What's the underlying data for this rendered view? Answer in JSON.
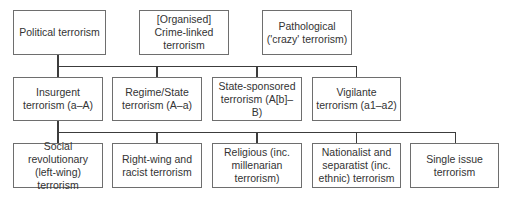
{
  "diagram": {
    "type": "typology-tree",
    "colors": {
      "border": "#6e6e6e",
      "connector": "#3c3c3c",
      "text": "#333333",
      "background": "#ffffff"
    },
    "top_row": [
      {
        "id": "political",
        "label": "Political terrorism"
      },
      {
        "id": "crime",
        "label": "[Organised] Crime-linked terrorism"
      },
      {
        "id": "pathological",
        "label": "Pathological ('crazy' terrorism)"
      }
    ],
    "political_children": [
      {
        "id": "insurgent",
        "label": "Insurgent terrorism (a–A)"
      },
      {
        "id": "regime",
        "label": "Regime/State terrorism (A–a)"
      },
      {
        "id": "state_sponsored",
        "label": "State-sponsored terrorism (A[b]–B)"
      },
      {
        "id": "vigilante",
        "label": "Vigilante terrorism (a1–a2)"
      }
    ],
    "insurgent_children": [
      {
        "id": "social_revolutionary",
        "label": "Social revolutionary (left-wing) terrorism"
      },
      {
        "id": "right_wing",
        "label": "Right-wing and racist terrorism"
      },
      {
        "id": "religious",
        "label": "Religious (inc. millenarian terrorism)"
      },
      {
        "id": "nationalist",
        "label": "Nationalist and separatist (inc. ethnic) terrorism"
      },
      {
        "id": "single_issue",
        "label": "Single issue terrorism"
      }
    ],
    "edges": [
      [
        "political",
        "insurgent"
      ],
      [
        "political",
        "regime"
      ],
      [
        "political",
        "state_sponsored"
      ],
      [
        "political",
        "vigilante"
      ],
      [
        "insurgent",
        "social_revolutionary"
      ],
      [
        "insurgent",
        "right_wing"
      ],
      [
        "insurgent",
        "religious"
      ],
      [
        "insurgent",
        "nationalist"
      ],
      [
        "insurgent",
        "single_issue"
      ]
    ]
  }
}
